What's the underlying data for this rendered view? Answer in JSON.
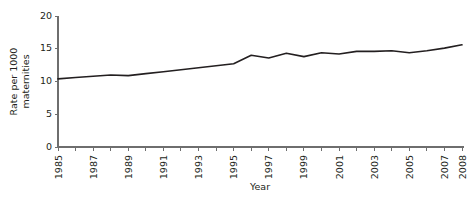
{
  "chart_data": {
    "type": "line",
    "title": "",
    "xlabel": "Year",
    "ylabel": "Rate per 1000 maternities",
    "ylabel_lines": [
      "Rate per 1000",
      "maternities"
    ],
    "x": [
      1985,
      1986,
      1987,
      1988,
      1989,
      1990,
      1991,
      1992,
      1993,
      1994,
      1995,
      1996,
      1997,
      1998,
      1999,
      2000,
      2001,
      2002,
      2003,
      2004,
      2005,
      2006,
      2007,
      2008
    ],
    "values": [
      10.4,
      10.6,
      10.8,
      11.0,
      10.9,
      11.2,
      11.5,
      11.8,
      12.1,
      12.4,
      12.7,
      14.0,
      13.6,
      14.3,
      13.8,
      14.4,
      14.2,
      14.6,
      14.6,
      14.7,
      14.4,
      14.7,
      15.1,
      15.6
    ],
    "series": [
      {
        "name": "Rate per 1000 maternities",
        "values": [
          10.4,
          10.6,
          10.8,
          11.0,
          10.9,
          11.2,
          11.5,
          11.8,
          12.1,
          12.4,
          12.7,
          14.0,
          13.6,
          14.3,
          13.8,
          14.4,
          14.2,
          14.6,
          14.6,
          14.7,
          14.4,
          14.7,
          15.1,
          15.6
        ]
      }
    ],
    "xlim": [
      1985,
      2008
    ],
    "ylim": [
      0,
      20
    ],
    "ytick_labels": [
      "0",
      "5",
      "10",
      "15",
      "20"
    ],
    "ytick_values": [
      0,
      5,
      10,
      15,
      20
    ],
    "xtick_labels": [
      "1985",
      "1987",
      "1989",
      "1991",
      "1993",
      "1995",
      "1997",
      "1999",
      "2001",
      "2003",
      "2005",
      "2007",
      "2008"
    ],
    "xtick_values": [
      1985,
      1987,
      1989,
      1991,
      1993,
      1995,
      1997,
      1999,
      2001,
      2003,
      2005,
      2007,
      2008
    ],
    "xminor_values": [
      1986,
      1988,
      1990,
      1992,
      1994,
      1996,
      1998,
      2000,
      2002,
      2004,
      2006
    ],
    "grid": false,
    "legend": false,
    "line_color": "#231f20",
    "axis_color": "#6e6e6e",
    "background_color": "#ffffff"
  }
}
